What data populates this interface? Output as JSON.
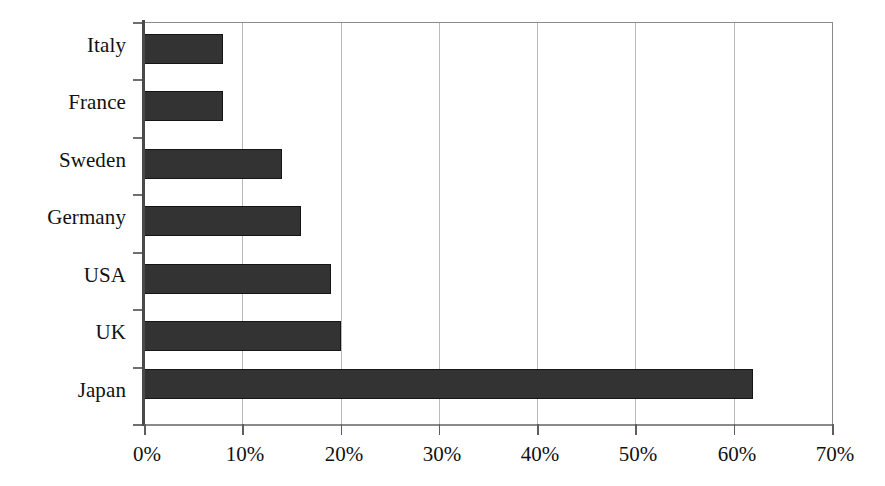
{
  "chart_data": {
    "type": "bar",
    "orientation": "horizontal",
    "title": "",
    "subtitle": "",
    "xlabel": "",
    "ylabel": "",
    "categories": [
      "Italy",
      "France",
      "Sweden",
      "Germany",
      "USA",
      "UK",
      "Japan"
    ],
    "values": [
      8,
      8,
      14,
      16,
      19,
      20,
      62
    ],
    "value_unit": "%",
    "series": [
      {
        "name": "",
        "values": [
          8,
          8,
          14,
          16,
          19,
          20,
          62
        ]
      }
    ],
    "xlim": [
      0,
      70
    ],
    "ylim": null,
    "xticks": [
      0,
      10,
      20,
      30,
      40,
      50,
      60,
      70
    ],
    "xtick_labels": [
      "0%",
      "10%",
      "20%",
      "30%",
      "40%",
      "50%",
      "60%",
      "70%"
    ],
    "ytick_labels": [
      "Italy",
      "France",
      "Sweden",
      "Germany",
      "USA",
      "UK",
      "Japan"
    ],
    "grid": {
      "vertical": true,
      "horizontal": false
    },
    "legend": {
      "present": false,
      "position": "none",
      "entries": []
    },
    "annotations": [],
    "data_labels": {
      "present": false
    },
    "colors": {
      "background": "#ffffff",
      "bar_fill": "#333333",
      "bar_edge": "#151515",
      "gridline": "#b9b9b9",
      "axis_line": "#8a8a8a",
      "value_axis_spine": "#4a4a4a",
      "tick_mark": "#5e5e5e",
      "text": "#111111"
    }
  }
}
